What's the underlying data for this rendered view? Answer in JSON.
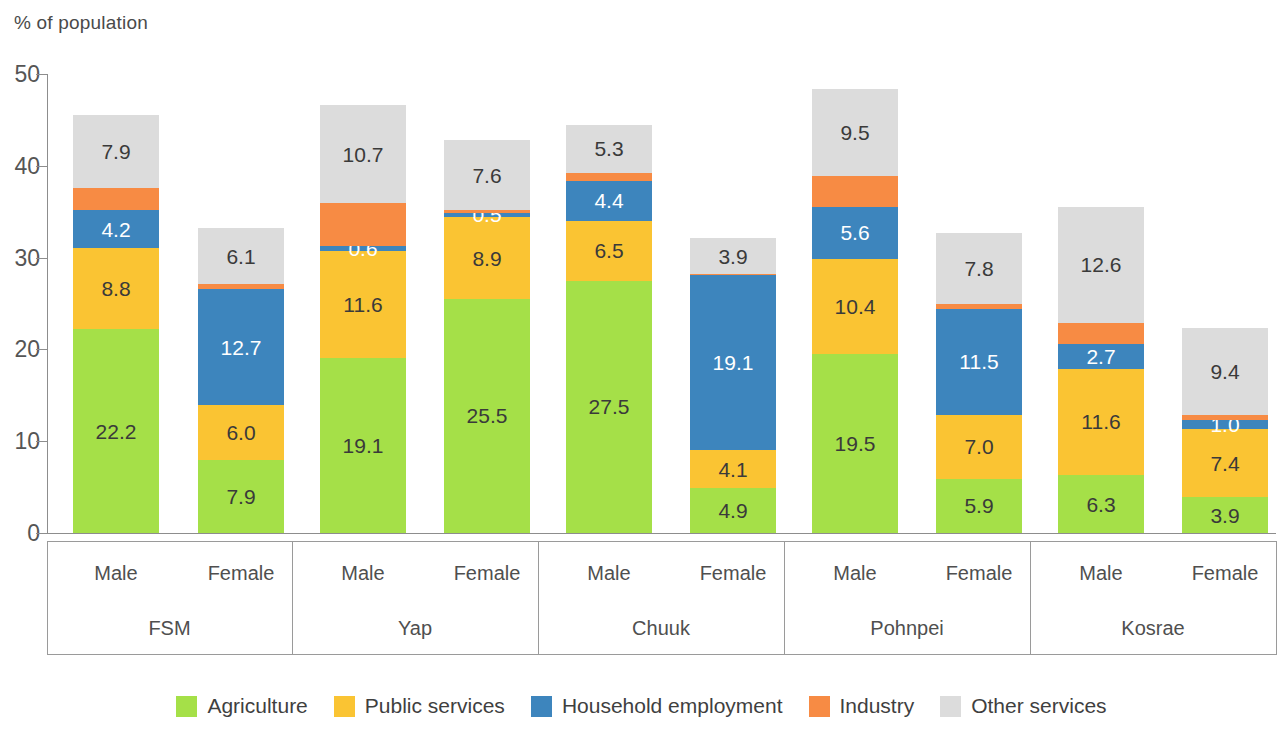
{
  "axis_title": "% of population",
  "legend": {
    "items": [
      {
        "label": "Agriculture",
        "color": "#a5e048"
      },
      {
        "label": "Public services",
        "color": "#fac433"
      },
      {
        "label": "Household employment",
        "color": "#3d85bd"
      },
      {
        "label": "Industry",
        "color": "#f78b44"
      },
      {
        "label": "Other services",
        "color": "#dcdcdc"
      }
    ]
  },
  "chart_data": {
    "type": "bar",
    "title": "",
    "subtitle": "",
    "xlabel": "",
    "ylabel": "% of population",
    "ylim": [
      0,
      50
    ],
    "yticks": [
      0,
      10,
      20,
      30,
      40,
      50
    ],
    "ytick_labels": [
      "0",
      "10",
      "20",
      "30",
      "40",
      "50"
    ],
    "grid": false,
    "stacked": true,
    "legend_position": "bottom",
    "groups": [
      "FSM",
      "Yap",
      "Chuuk",
      "Pohnpei",
      "Kosrae"
    ],
    "subcategories": [
      "Male",
      "Female"
    ],
    "categories": [
      "FSM Male",
      "FSM Female",
      "Yap Male",
      "Yap Female",
      "Chuuk Male",
      "Chuuk Female",
      "Pohnpei Male",
      "Pohnpei Female",
      "Kosrae Male",
      "Kosrae Female"
    ],
    "series": [
      {
        "name": "Agriculture",
        "color": "#a5e048",
        "values": [
          22.2,
          7.9,
          19.1,
          25.5,
          27.5,
          4.9,
          19.5,
          5.9,
          6.3,
          3.9
        ]
      },
      {
        "name": "Public services",
        "color": "#fac433",
        "values": [
          8.8,
          6.0,
          11.6,
          8.9,
          6.5,
          4.1,
          10.4,
          7.0,
          11.6,
          7.4
        ]
      },
      {
        "name": "Household employment",
        "color": "#3d85bd",
        "values": [
          4.2,
          12.7,
          0.6,
          0.5,
          4.4,
          19.1,
          5.6,
          11.5,
          2.7,
          1.0
        ]
      },
      {
        "name": "Industry",
        "color": "#f78b44",
        "values": [
          2.4,
          0.5,
          4.6,
          0.3,
          0.8,
          0.1,
          3.4,
          0.5,
          2.3,
          0.6
        ]
      },
      {
        "name": "Other services",
        "color": "#dcdcdc",
        "values": [
          7.9,
          6.1,
          10.7,
          7.6,
          5.3,
          3.9,
          9.5,
          7.8,
          12.6,
          9.4
        ]
      }
    ],
    "totals": [
      45.5,
      33.2,
      46.6,
      42.8,
      44.5,
      32.1,
      48.4,
      32.7,
      35.5,
      22.3
    ],
    "data_labels": {
      "FSM Male": {
        "Agriculture": "22.2",
        "Public services": "8.8",
        "Household employment": "4.2",
        "Industry": "",
        "Other services": "7.9"
      },
      "FSM Female": {
        "Agriculture": "7.9",
        "Public services": "6.0",
        "Household employment": "12.7",
        "Industry": "",
        "Other services": "6.1"
      },
      "Yap Male": {
        "Agriculture": "19.1",
        "Public services": "11.6",
        "Household employment": "0.6",
        "Industry": "",
        "Other services": "10.7"
      },
      "Yap Female": {
        "Agriculture": "25.5",
        "Public services": "8.9",
        "Household employment": "0.5",
        "Industry": "",
        "Other services": "7.6"
      },
      "Chuuk Male": {
        "Agriculture": "27.5",
        "Public services": "6.5",
        "Household employment": "4.4",
        "Industry": "",
        "Other services": "5.3"
      },
      "Chuuk Female": {
        "Agriculture": "4.9",
        "Public services": "4.1",
        "Household employment": "19.1",
        "Industry": "",
        "Other services": "3.9"
      },
      "Pohnpei Male": {
        "Agriculture": "19.5",
        "Public services": "10.4",
        "Household employment": "5.6",
        "Industry": "",
        "Other services": "9.5"
      },
      "Pohnpei Female": {
        "Agriculture": "5.9",
        "Public services": "7.0",
        "Household employment": "11.5",
        "Industry": "",
        "Other services": "7.8"
      },
      "Kosrae Male": {
        "Agriculture": "6.3",
        "Public services": "11.6",
        "Household employment": "2.7",
        "Industry": "",
        "Other services": "12.6"
      },
      "Kosrae Female": {
        "Agriculture": "3.9",
        "Public services": "7.4",
        "Household employment": "1.0",
        "Industry": "",
        "Other services": "9.4"
      }
    }
  }
}
